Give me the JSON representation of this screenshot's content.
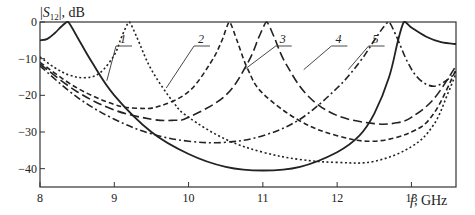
{
  "chart_data": {
    "type": "line",
    "title": "",
    "ylabel": "|S12|, dB",
    "ylabel_main": "|S",
    "ylabel_sub": "12",
    "ylabel_tail": "|, dB",
    "xlabel": "f, GHz",
    "xlabel_var": "f",
    "xlabel_unit": ", GHz",
    "xlim": [
      8,
      13.6
    ],
    "ylim": [
      -45,
      0
    ],
    "x_ticks": [
      8,
      9,
      10,
      11,
      12,
      13
    ],
    "y_ticks": [
      0,
      -10,
      -20,
      -30,
      -40
    ],
    "grid": false,
    "legend": "inline numbered leader labels",
    "series": [
      {
        "name": "1",
        "style": "solid",
        "x": [
          8.0,
          8.1,
          8.2,
          8.3,
          8.38,
          8.5,
          8.7,
          9.0,
          9.5,
          10.0,
          10.5,
          11.0,
          11.5,
          12.0,
          12.3,
          12.5,
          12.7,
          12.82,
          12.9,
          13.0,
          13.2,
          13.4,
          13.6
        ],
        "y": [
          -5,
          -4.6,
          -3,
          -1,
          0,
          -4,
          -11,
          -20,
          -30,
          -36,
          -39.5,
          -40.5,
          -39.5,
          -35.5,
          -31,
          -25,
          -15,
          -5,
          0,
          -1.5,
          -4,
          -5.5,
          -6
        ]
      },
      {
        "name": "2",
        "style": "dotted",
        "x": [
          8.0,
          8.2,
          8.4,
          8.6,
          8.8,
          9.0,
          9.1,
          9.2,
          9.3,
          9.5,
          9.8,
          10.0,
          10.5,
          11.0,
          11.5,
          12.0,
          12.5,
          13.0,
          13.3,
          13.5,
          13.6
        ],
        "y": [
          -9.5,
          -12.5,
          -14.5,
          -15.2,
          -14,
          -9,
          -4,
          0,
          -4,
          -13,
          -22,
          -26,
          -32,
          -35.5,
          -37.5,
          -38.3,
          -38,
          -34,
          -28,
          -19,
          -14
        ]
      },
      {
        "name": "3",
        "style": "short-dash",
        "x": [
          8.0,
          8.5,
          9.0,
          9.3,
          9.6,
          10.0,
          10.3,
          10.45,
          10.55,
          10.65,
          10.8,
          11.0,
          11.5,
          12.0,
          12.5,
          13.0,
          13.3,
          13.6
        ],
        "y": [
          -11,
          -18,
          -22.5,
          -23.5,
          -23,
          -19,
          -11,
          -5,
          0,
          -5,
          -13,
          -19.5,
          -27,
          -31,
          -32.5,
          -30,
          -25,
          -13
        ]
      },
      {
        "name": "4",
        "style": "long-dash",
        "x": [
          8.0,
          8.5,
          9.0,
          9.5,
          9.8,
          10.0,
          10.5,
          10.8,
          10.95,
          11.05,
          11.15,
          11.3,
          11.6,
          12.0,
          12.5,
          12.8,
          13.0,
          13.3,
          13.6
        ],
        "y": [
          -11.5,
          -19,
          -24,
          -26.5,
          -26.8,
          -26,
          -20,
          -11,
          -4,
          0,
          -4,
          -11,
          -20,
          -25.5,
          -27.7,
          -27.5,
          -26,
          -21,
          -12
        ]
      },
      {
        "name": "5",
        "style": "dash-dot",
        "x": [
          8.0,
          8.5,
          9.0,
          9.5,
          10.0,
          10.5,
          11.0,
          11.5,
          12.0,
          12.3,
          12.5,
          12.62,
          12.7,
          12.8,
          12.95,
          13.1,
          13.3,
          13.5,
          13.6
        ],
        "y": [
          -12,
          -20.5,
          -26.5,
          -30.5,
          -32.5,
          -32.8,
          -31,
          -26.5,
          -18,
          -11,
          -5,
          -1.5,
          0,
          -4,
          -11,
          -15.5,
          -17.5,
          -15.5,
          -13.5
        ]
      }
    ],
    "annotations": [
      {
        "text": "1",
        "label_x": 9.05,
        "label_y": -6,
        "points_to": [
          8.9,
          -16
        ]
      },
      {
        "text": "2",
        "label_x": 10.1,
        "label_y": -6,
        "points_to": [
          9.7,
          -18
        ]
      },
      {
        "text": "3",
        "label_x": 11.2,
        "label_y": -6,
        "points_to": [
          10.75,
          -13
        ]
      },
      {
        "text": "4",
        "label_x": 11.95,
        "label_y": -6,
        "points_to": [
          11.55,
          -13
        ]
      },
      {
        "text": "5",
        "label_x": 12.45,
        "label_y": -6,
        "points_to": [
          12.15,
          -13
        ]
      }
    ]
  }
}
